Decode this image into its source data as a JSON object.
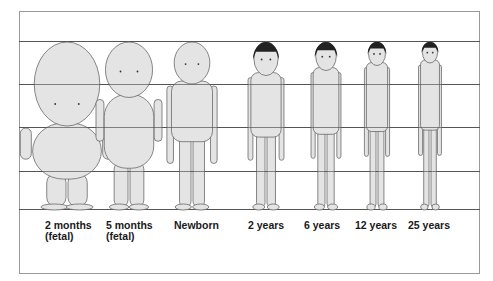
{
  "stages": [
    {
      "label_line1": "2 months",
      "label_line2": "(fetal)",
      "head_fraction": 0.5
    },
    {
      "label_line1": "5 months",
      "label_line2": "(fetal)",
      "head_fraction": 0.33
    },
    {
      "label_line1": "Newborn",
      "label_line2": "",
      "head_fraction": 0.25
    },
    {
      "label_line1": "2 years",
      "label_line2": "",
      "head_fraction": 0.2
    },
    {
      "label_line1": "6 years",
      "label_line2": "",
      "head_fraction": 0.17
    },
    {
      "label_line1": "12 years",
      "label_line2": "",
      "head_fraction": 0.14
    },
    {
      "label_line1": "25 years",
      "label_line2": "",
      "head_fraction": 0.125
    }
  ],
  "colors": {
    "skin": "#e4e4e4",
    "outline": "#6a6a6a",
    "hair": "#222222",
    "grid": "#555555"
  }
}
